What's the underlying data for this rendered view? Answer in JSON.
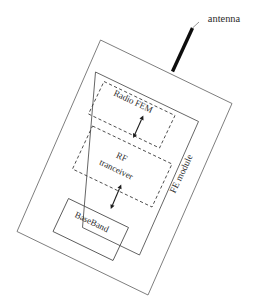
{
  "diagram": {
    "style": {
      "background": "#ffffff",
      "line_color": "#555555",
      "dashed_line_color": "#3a3a3a",
      "text_color": "#2b2b2b",
      "antenna_color": "#0d0d0d",
      "rotation_degrees": 25.5
    },
    "annotations": {
      "antenna_label": "antenna"
    },
    "blocks": [
      {
        "id": "device-boundary",
        "label": "",
        "border": "solid",
        "role": "outer-device-boundary"
      },
      {
        "id": "fe-module",
        "label": "FE module",
        "border": "solid",
        "role": "front-end-module",
        "label_orientation": "rotated"
      },
      {
        "id": "radio-fem",
        "label": "Radio FEM",
        "border": "dashed",
        "role": "radio-front-end-module"
      },
      {
        "id": "rf-tranceiver",
        "label_line1": "RF",
        "label_line2": "tranceiver",
        "label": "RF tranceiver",
        "border": "dashed",
        "role": "rf-transceiver"
      },
      {
        "id": "baseband",
        "label": "BaseBand",
        "border": "solid",
        "role": "baseband-processor"
      }
    ],
    "connections": [
      {
        "id": "antenna-to-fe-module",
        "from": "antenna",
        "to": "fe-module",
        "type": "line",
        "arrows": "none"
      },
      {
        "id": "radio-fem-to-rf-tranceiver",
        "from": "radio-fem",
        "to": "rf-tranceiver",
        "type": "arrow",
        "arrows": "both"
      },
      {
        "id": "rf-tranceiver-to-baseband",
        "from": "rf-tranceiver",
        "to": "baseband",
        "type": "arrow",
        "arrows": "both"
      }
    ]
  }
}
